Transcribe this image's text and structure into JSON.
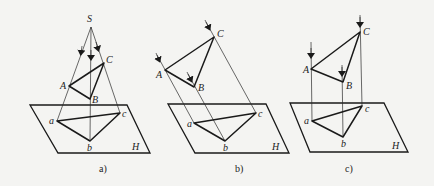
{
  "diagram": {
    "panels": [
      {
        "id": "a",
        "caption": "a)",
        "type": "central",
        "source_label": "S",
        "points_upper": {
          "A": "A",
          "B": "B",
          "C": "C"
        },
        "points_lower": {
          "a": "a",
          "b": "b",
          "c": "c"
        },
        "plane_label": "H"
      },
      {
        "id": "b",
        "caption": "b)",
        "type": "oblique-parallel",
        "points_upper": {
          "A": "A",
          "B": "B",
          "C": "C"
        },
        "points_lower": {
          "a": "a",
          "b": "b",
          "c": "c"
        },
        "plane_label": "H"
      },
      {
        "id": "c",
        "caption": "c)",
        "type": "orthogonal-parallel",
        "points_upper": {
          "A": "A",
          "B": "B",
          "C": "C"
        },
        "points_lower": {
          "a": "a",
          "b": "b",
          "c": "c"
        },
        "plane_label": "H"
      }
    ],
    "colors": {
      "line": "#1a1a1a",
      "background": "#f4f4f2"
    }
  }
}
